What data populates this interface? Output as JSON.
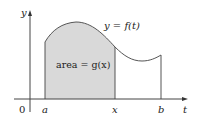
{
  "figure": {
    "type": "area-under-curve diagram",
    "curve_label": "y = f(t)",
    "area_label": "area = g(x)",
    "axes": {
      "x_axis_label": "t",
      "y_axis_label": "y",
      "origin_label": "0",
      "x_ticks": [
        "a",
        "x",
        "b"
      ]
    },
    "colors": {
      "fill": "#d9d9d9",
      "stroke": "#555555",
      "axis": "#444444"
    }
  }
}
